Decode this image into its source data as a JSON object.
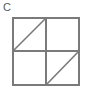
{
  "figure": {
    "label": "C",
    "label_color": "#595959",
    "background_color": "#ffffff",
    "line_color": "#7a7a7a",
    "line_width": 1.6,
    "square": {
      "left": 13,
      "top": 18,
      "right": 79,
      "bottom": 85
    },
    "midlines": {
      "vertical_x": 46,
      "horizontal_y": 51
    },
    "shapes": [
      {
        "name": "outer-square",
        "type": "rect",
        "points": [
          [
            13,
            18
          ],
          [
            79,
            18
          ],
          [
            79,
            85
          ],
          [
            13,
            85
          ]
        ]
      },
      {
        "name": "vertical-midline",
        "type": "line",
        "points": [
          [
            46,
            18
          ],
          [
            46,
            85
          ]
        ]
      },
      {
        "name": "horizontal-midline",
        "type": "line",
        "points": [
          [
            13,
            51
          ],
          [
            79,
            51
          ]
        ]
      },
      {
        "name": "top-left-diagonal",
        "type": "line",
        "points": [
          [
            13,
            51
          ],
          [
            46,
            18
          ]
        ]
      },
      {
        "name": "bottom-right-diagonal",
        "type": "line",
        "points": [
          [
            46,
            85
          ],
          [
            79,
            51
          ]
        ]
      }
    ],
    "quadrants": [
      {
        "name": "top-left",
        "has_diagonal": true,
        "diagonal_direction": "bottom-left-to-top-right"
      },
      {
        "name": "top-right",
        "has_diagonal": false,
        "diagonal_direction": ""
      },
      {
        "name": "bottom-left",
        "has_diagonal": false,
        "diagonal_direction": ""
      },
      {
        "name": "bottom-right",
        "has_diagonal": true,
        "diagonal_direction": "bottom-left-to-top-right"
      }
    ]
  }
}
